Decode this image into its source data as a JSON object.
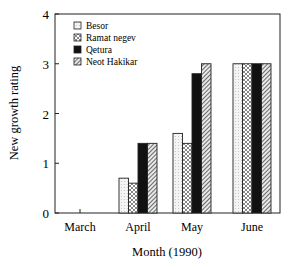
{
  "chart_data": {
    "type": "bar",
    "title": "",
    "xlabel": "Month (1990)",
    "ylabel": "New growth rating",
    "categories": [
      "March",
      "April",
      "May",
      "June"
    ],
    "series": [
      {
        "name": "Besor",
        "pattern": "light-dots",
        "values": [
          0,
          0.7,
          1.6,
          3.0
        ]
      },
      {
        "name": "Ramat negev",
        "pattern": "crosshatch-dots",
        "values": [
          0,
          0.6,
          1.4,
          3.0
        ]
      },
      {
        "name": "Qetura",
        "pattern": "solid-black",
        "values": [
          0,
          1.4,
          2.8,
          3.0
        ]
      },
      {
        "name": "Neot Hakikar",
        "pattern": "diagonal-hatch",
        "values": [
          0,
          1.4,
          3.0,
          3.0
        ]
      }
    ],
    "ylim": [
      0,
      4
    ],
    "yticks": [
      0,
      1,
      2,
      3,
      4
    ],
    "grid": false,
    "legend_position": "upper-left-inside"
  },
  "legend": {
    "items": [
      "Besor",
      "Ramat negev",
      "Qetura",
      "Neot Hakikar"
    ]
  },
  "axes": {
    "ylabel": "New growth rating",
    "xlabel": "Month (1990)",
    "yticks": [
      "0",
      "1",
      "2",
      "3",
      "4"
    ],
    "xticks": [
      "March",
      "April",
      "May",
      "June"
    ]
  }
}
